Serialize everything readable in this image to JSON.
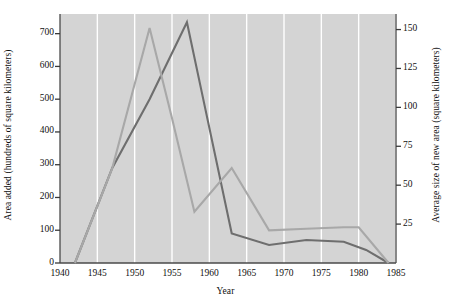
{
  "chart_data": {
    "type": "line",
    "title": "",
    "xlabel": "Year",
    "ylabel": "Area added (hundreds of square kilometers)",
    "ylabel_right": "Average size of new area (square kilometers)",
    "xlim": [
      1940,
      1985
    ],
    "ylim": [
      0,
      760
    ],
    "ylim_right": [
      0,
      160
    ],
    "grid": "vertical",
    "legend": "none",
    "background": "#d4d4d4",
    "xticks": [
      1940,
      1945,
      1950,
      1955,
      1960,
      1965,
      1970,
      1975,
      1980,
      1985
    ],
    "xtick_labels": [
      "1940",
      "1945",
      "1950",
      "1955",
      "1960",
      "1965",
      "1970",
      "1975",
      "1980",
      "1985"
    ],
    "yticks": [
      0,
      100,
      200,
      300,
      400,
      500,
      600,
      700
    ],
    "ytick_labels": [
      "0",
      "100",
      "200",
      "300",
      "400",
      "500",
      "600",
      "700"
    ],
    "yticks_right": [
      25,
      50,
      75,
      100,
      125,
      150
    ],
    "ytick_labels_right": [
      "25",
      "50",
      "75",
      "100",
      "125",
      "150"
    ],
    "series": [
      {
        "name": "Area added",
        "axis": "left",
        "color": "#6e6e6e",
        "x": [
          1942,
          1947,
          1952,
          1957,
          1959,
          1963,
          1968,
          1973,
          1978,
          1981,
          1984
        ],
        "values": [
          0,
          290,
          500,
          735,
          520,
          90,
          55,
          70,
          65,
          40,
          0
        ]
      },
      {
        "name": "Average size of new area",
        "axis": "right",
        "color": "#a8a8a8",
        "x": [
          1942,
          1947,
          1952,
          1955,
          1958,
          1963,
          1968,
          1973,
          1978,
          1980,
          1984
        ],
        "values": [
          0,
          61,
          151,
          93,
          33,
          61,
          21,
          22,
          23,
          23,
          0
        ]
      }
    ]
  }
}
